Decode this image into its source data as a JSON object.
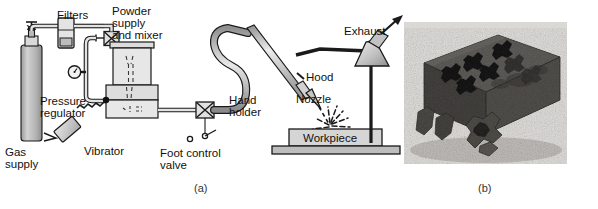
{
  "figure": {
    "panel_a": {
      "caption": "(a)",
      "labels": {
        "filters": "Filters",
        "powder_supply": [
          "Powder",
          "supply",
          "and mixer"
        ],
        "pressure_regulator": [
          "Pressure",
          "regulator"
        ],
        "gas_supply": [
          "Gas",
          "supply"
        ],
        "vibrator": "Vibrator",
        "foot_control_valve": [
          "Foot control",
          "valve"
        ],
        "hand_holder": [
          "Hand",
          "holder"
        ],
        "nozzle": "Nozzle",
        "hood": "Hood",
        "exhaust": "Exhaust",
        "workpiece": "Workpiece"
      }
    },
    "panel_b": {
      "caption": "(b)",
      "description": "Photograph of a dark block with star/cross shaped holes cut through it and cut-out pieces resting in front"
    }
  },
  "colors": {
    "background": "#ffffff",
    "outline": "#1a1a1a",
    "fill_light": "#e2e2e2",
    "fill_mid": "#c9c9c9",
    "fill_dark": "#a8a8a8",
    "photo_block": "#4a4a4a",
    "photo_hole": "#121212",
    "photo_bg": "#d8d6d2",
    "text": "#111111"
  }
}
